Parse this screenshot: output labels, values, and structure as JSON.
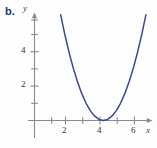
{
  "figure": {
    "part_label": "b.",
    "background": "#fdfdfd"
  },
  "chart_data": {
    "type": "line",
    "title": "",
    "subtitle": "",
    "xlabel": "x",
    "ylabel": "y",
    "curve_color": "#3a4a8c",
    "axis_color": "#8a8a8a",
    "grid": false,
    "legend": null,
    "xlim": [
      -0.3,
      7.0
    ],
    "ylim": [
      -1.0,
      6.5
    ],
    "x_ticks": [
      2,
      4,
      6
    ],
    "x_tick_labels": [
      "2",
      "4",
      "6"
    ],
    "x_minor_ticks": [
      1,
      3,
      5,
      7
    ],
    "y_ticks": [
      2,
      4
    ],
    "y_tick_labels": [
      "2",
      "4"
    ],
    "y_minor_ticks": [
      1,
      3,
      5,
      6
    ],
    "vertex": [
      4,
      0
    ],
    "equation": "y = (x - 4)^2",
    "series": [
      {
        "name": "parabola",
        "x": [
          1.52,
          1.75,
          2.0,
          2.25,
          2.5,
          2.75,
          3.0,
          3.25,
          3.5,
          3.75,
          4.0,
          4.25,
          4.5,
          4.75,
          5.0,
          5.25,
          5.5,
          5.75,
          6.0,
          6.25,
          6.48
        ],
        "y": [
          6.15,
          5.06,
          4.0,
          3.06,
          2.25,
          1.56,
          1.0,
          0.56,
          0.25,
          0.06,
          0.0,
          0.06,
          0.25,
          0.56,
          1.0,
          1.56,
          2.25,
          3.06,
          4.0,
          5.06,
          6.15
        ]
      }
    ]
  },
  "labels": {
    "y_axis_name": "y",
    "x_axis_name": "x",
    "y_tick_4": "4",
    "y_tick_2": "2",
    "x_tick_2": "2",
    "x_tick_4": "4",
    "x_tick_6": "6"
  }
}
